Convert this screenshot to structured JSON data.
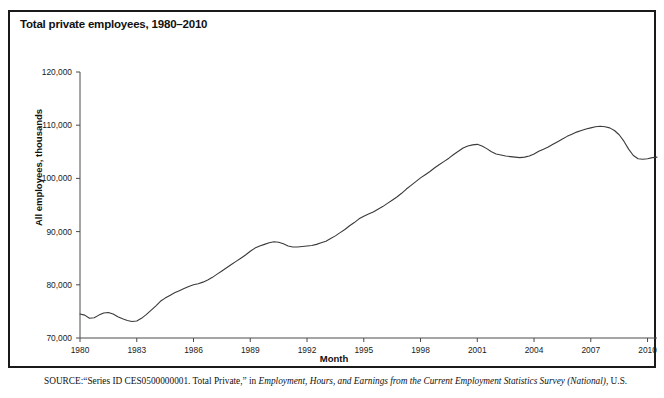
{
  "figure": {
    "title": "Total private employees, 1980–2010",
    "border_color": "#1a1a1a",
    "line_color": "#3a3a3a"
  },
  "source": {
    "label": "SOURCE:",
    "text_part1": "“Series ID CES0500000001. Total Private,” in ",
    "italic1": "Employment, Hours, and Earnings from the Current Employment Statistics Survey (National)",
    "text_part2": ", U.S."
  },
  "chart_data": {
    "type": "line",
    "title": "Total private employees, 1980–2010",
    "xlabel": "Month",
    "ylabel": "All employees, thousands",
    "xlim": [
      1980,
      2010.5
    ],
    "ylim": [
      70000,
      120000
    ],
    "xticks": [
      1980,
      1983,
      1986,
      1989,
      1992,
      1995,
      1998,
      2001,
      2004,
      2007,
      2010
    ],
    "xtick_labels": [
      "1980",
      "1983",
      "1986",
      "1989",
      "1992",
      "1995",
      "1998",
      "2001",
      "2004",
      "2007",
      "2010"
    ],
    "yticks": [
      70000,
      80000,
      90000,
      100000,
      110000,
      120000
    ],
    "ytick_labels": [
      "70,000",
      "80,000",
      "90,000",
      "100,000",
      "110,000",
      "120,000"
    ],
    "grid": false,
    "legend": "none",
    "series": [
      {
        "name": "All employees, total private (thousands)",
        "x": [
          1980.0,
          1980.25,
          1980.5,
          1980.75,
          1981.0,
          1981.25,
          1981.5,
          1981.75,
          1982.0,
          1982.25,
          1982.5,
          1982.75,
          1983.0,
          1983.25,
          1983.5,
          1983.75,
          1984.0,
          1984.25,
          1984.5,
          1984.75,
          1985.0,
          1985.25,
          1985.5,
          1985.75,
          1986.0,
          1986.25,
          1986.5,
          1986.75,
          1987.0,
          1987.25,
          1987.5,
          1987.75,
          1988.0,
          1988.25,
          1988.5,
          1988.75,
          1989.0,
          1989.25,
          1989.5,
          1989.75,
          1990.0,
          1990.25,
          1990.5,
          1990.75,
          1991.0,
          1991.25,
          1991.5,
          1991.75,
          1992.0,
          1992.25,
          1992.5,
          1992.75,
          1993.0,
          1993.25,
          1993.5,
          1993.75,
          1994.0,
          1994.25,
          1994.5,
          1994.75,
          1995.0,
          1995.25,
          1995.5,
          1995.75,
          1996.0,
          1996.25,
          1996.5,
          1996.75,
          1997.0,
          1997.25,
          1997.5,
          1997.75,
          1998.0,
          1998.25,
          1998.5,
          1998.75,
          1999.0,
          1999.25,
          1999.5,
          1999.75,
          2000.0,
          2000.25,
          2000.5,
          2000.75,
          2001.0,
          2001.25,
          2001.5,
          2001.75,
          2002.0,
          2002.25,
          2002.5,
          2002.75,
          2003.0,
          2003.25,
          2003.5,
          2003.75,
          2004.0,
          2004.25,
          2004.5,
          2004.75,
          2005.0,
          2005.25,
          2005.5,
          2005.75,
          2006.0,
          2006.25,
          2006.5,
          2006.75,
          2007.0,
          2007.25,
          2007.5,
          2007.75,
          2008.0,
          2008.25,
          2008.5,
          2008.75,
          2009.0,
          2009.25,
          2009.5,
          2009.75,
          2010.0,
          2010.25,
          2010.5
        ],
        "y": [
          74500,
          74300,
          73700,
          73800,
          74300,
          74700,
          74800,
          74500,
          74000,
          73600,
          73300,
          73100,
          73200,
          73700,
          74400,
          75200,
          76000,
          76900,
          77500,
          78000,
          78500,
          78900,
          79300,
          79700,
          80000,
          80200,
          80500,
          80900,
          81400,
          82000,
          82600,
          83200,
          83800,
          84400,
          85000,
          85600,
          86300,
          86900,
          87300,
          87600,
          87900,
          88100,
          88000,
          87700,
          87300,
          87100,
          87100,
          87200,
          87300,
          87400,
          87600,
          87900,
          88200,
          88700,
          89200,
          89800,
          90400,
          91100,
          91700,
          92400,
          92900,
          93300,
          93700,
          94200,
          94700,
          95300,
          95900,
          96500,
          97200,
          98000,
          98700,
          99400,
          100100,
          100700,
          101300,
          102000,
          102600,
          103200,
          103800,
          104500,
          105100,
          105700,
          106100,
          106300,
          106400,
          106100,
          105600,
          105000,
          104600,
          104400,
          104200,
          104100,
          104000,
          103900,
          104000,
          104200,
          104600,
          105100,
          105500,
          105900,
          106400,
          106900,
          107400,
          107900,
          108300,
          108700,
          109000,
          109300,
          109500,
          109700,
          109800,
          109700,
          109500,
          109000,
          108200,
          107000,
          105500,
          104300,
          103700,
          103600,
          103700,
          103900,
          104000
        ]
      }
    ],
    "annotations": [
      {
        "label": "1980–82 recession trough",
        "x": 1982.75,
        "y": 73100
      },
      {
        "label": "1990–91 recession plateau",
        "x": 1991.5,
        "y": 87100
      },
      {
        "label": "dot-com peak",
        "x": 2001.0,
        "y": 106400
      },
      {
        "label": "2003 trough",
        "x": 2003.25,
        "y": 103900
      },
      {
        "label": "pre-recession peak",
        "x": 2007.5,
        "y": 109800
      },
      {
        "label": "Great Recession trough",
        "x": 2009.75,
        "y": 103600
      }
    ]
  }
}
